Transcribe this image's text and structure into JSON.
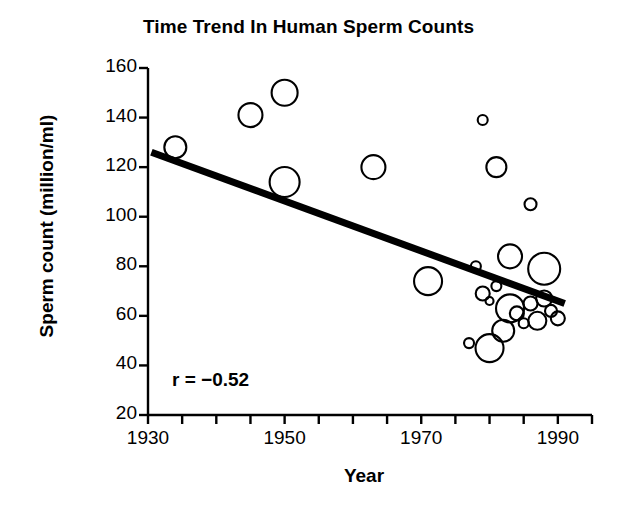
{
  "chart_data": {
    "type": "scatter",
    "title": "Time Trend In Human Sperm Counts",
    "xlabel": "Year",
    "ylabel": "Sperm count (million/ml)",
    "xlim": [
      1930,
      1995
    ],
    "ylim": [
      20,
      160
    ],
    "xticks": [
      1930,
      1935,
      1940,
      1945,
      1950,
      1955,
      1960,
      1965,
      1970,
      1975,
      1980,
      1985,
      1990,
      1995
    ],
    "xtick_labels": [
      "1930",
      "1950",
      "1970",
      "1990"
    ],
    "xtick_label_values": [
      1930,
      1950,
      1970,
      1990
    ],
    "yticks": [
      20,
      40,
      60,
      80,
      100,
      120,
      140,
      160
    ],
    "ytick_labels": [
      "20",
      "40",
      "60",
      "80",
      "100",
      "120",
      "140",
      "160"
    ],
    "grid": false,
    "legend": false,
    "marker_style": "open-circle",
    "marker_note": "bubble size encodes study sample size",
    "annotations": [
      {
        "text": "r = −0.52",
        "x": 1938,
        "y": 34
      }
    ],
    "trendline": {
      "type": "linear",
      "x": [
        1930.5,
        1991
      ],
      "y": [
        126,
        65
      ],
      "color": "#000000",
      "width": 7
    },
    "series": [
      {
        "name": "Sperm count studies",
        "color": "#000000",
        "points": [
          {
            "x": 1934,
            "y": 128,
            "r": 11
          },
          {
            "x": 1945,
            "y": 141,
            "r": 12
          },
          {
            "x": 1950,
            "y": 150,
            "r": 13
          },
          {
            "x": 1950,
            "y": 114,
            "r": 15
          },
          {
            "x": 1963,
            "y": 120,
            "r": 12
          },
          {
            "x": 1971,
            "y": 74,
            "r": 14
          },
          {
            "x": 1977,
            "y": 49,
            "r": 5
          },
          {
            "x": 1979,
            "y": 139,
            "r": 5
          },
          {
            "x": 1978,
            "y": 80,
            "r": 5
          },
          {
            "x": 1979,
            "y": 69,
            "r": 7
          },
          {
            "x": 1980,
            "y": 66,
            "r": 4
          },
          {
            "x": 1981,
            "y": 120,
            "r": 10
          },
          {
            "x": 1980,
            "y": 47,
            "r": 14
          },
          {
            "x": 1982,
            "y": 54,
            "r": 11
          },
          {
            "x": 1981,
            "y": 72,
            "r": 5
          },
          {
            "x": 1983,
            "y": 84,
            "r": 12
          },
          {
            "x": 1983,
            "y": 63,
            "r": 14
          },
          {
            "x": 1984,
            "y": 61,
            "r": 7
          },
          {
            "x": 1985,
            "y": 57,
            "r": 5
          },
          {
            "x": 1986,
            "y": 105,
            "r": 6
          },
          {
            "x": 1986,
            "y": 65,
            "r": 7
          },
          {
            "x": 1987,
            "y": 58,
            "r": 9
          },
          {
            "x": 1988,
            "y": 79,
            "r": 16
          },
          {
            "x": 1988,
            "y": 67,
            "r": 8
          },
          {
            "x": 1989,
            "y": 62,
            "r": 6
          },
          {
            "x": 1990,
            "y": 59,
            "r": 7
          }
        ]
      }
    ]
  },
  "axes": {
    "x_label": "Year",
    "y_label": "Sperm count (million/ml)"
  },
  "title": "Time Trend In Human Sperm Counts",
  "annotation": {
    "correlation": "r = −0.52"
  }
}
